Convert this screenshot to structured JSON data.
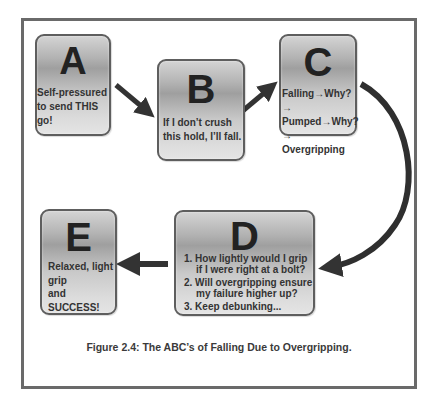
{
  "figure": {
    "caption": "Figure 2.4: The ABC’s of Falling Due to Overgripping.",
    "colors": {
      "frame": "#6a6a6a",
      "arrow": "#333333",
      "box_border": "#5e5e5e",
      "text": "#333333"
    },
    "boxes": {
      "A": {
        "letter": "A",
        "lines": [
          "Self-pressured",
          "to send THIS go!"
        ]
      },
      "B": {
        "letter": "B",
        "lines": [
          "If I don’t crush",
          "this hold, I’ll fall."
        ]
      },
      "C": {
        "letter": "C",
        "lines": [
          "Falling→Why?→",
          "Pumped→Why?→",
          "Overgripping"
        ]
      },
      "D": {
        "letter": "D",
        "items": [
          "1. How lightly would I grip if I were right at a bolt?",
          "2. Will overgripping ensure my failure higher up?",
          "3. Keep debunking..."
        ]
      },
      "E": {
        "letter": "E",
        "lines": [
          "Relaxed, light",
          "grip",
          "and",
          "SUCCESS!"
        ]
      }
    },
    "connectors": [
      {
        "from": "A",
        "to": "B",
        "shape": "straight-arrow"
      },
      {
        "from": "B",
        "to": "C",
        "shape": "straight-arrow"
      },
      {
        "from": "C",
        "to": "D",
        "shape": "curved-arrow"
      },
      {
        "from": "D",
        "to": "E",
        "shape": "straight-arrow"
      }
    ]
  }
}
